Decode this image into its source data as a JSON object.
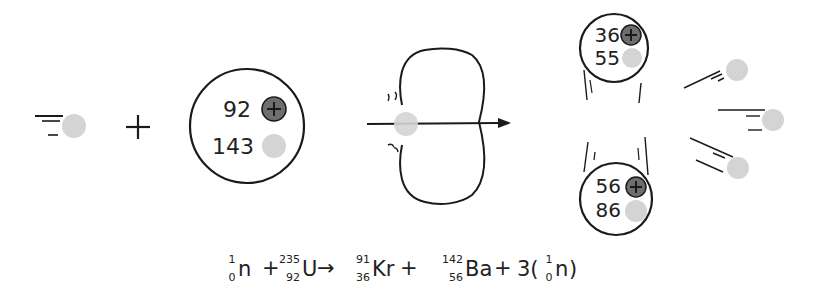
{
  "diagram": {
    "colors": {
      "proton": "#6e6e6e",
      "neutron": "#d4d4d4",
      "outline": "#1a1a1a",
      "background": "#ffffff"
    },
    "incoming_neutron": {
      "label": "neutron"
    },
    "plus_sign": "+",
    "uranium_nucleus": {
      "protons": "92",
      "neutrons": "143"
    },
    "compound_nucleus": {
      "label": "deformed U-236 nucleus"
    },
    "products": {
      "krypton": {
        "protons": "36",
        "neutrons": "55"
      },
      "barium": {
        "protons": "56",
        "neutrons": "86"
      },
      "released_neutrons": 3
    },
    "equation": {
      "neutron_in": {
        "mass": "1",
        "atomic": "0",
        "symbol": "n"
      },
      "plus1": "+",
      "uranium": {
        "mass": "235",
        "atomic": "92",
        "symbol": "U"
      },
      "arrow": "→",
      "krypton": {
        "mass": "91",
        "atomic": "36",
        "symbol": "Kr"
      },
      "plus2": "+",
      "barium": {
        "mass": "142",
        "atomic": "56",
        "symbol": "Ba"
      },
      "plus3": "+",
      "coefficient": "3(",
      "neutron_out": {
        "mass": "1",
        "atomic": "0",
        "symbol": "n"
      },
      "close_paren": ")"
    }
  }
}
